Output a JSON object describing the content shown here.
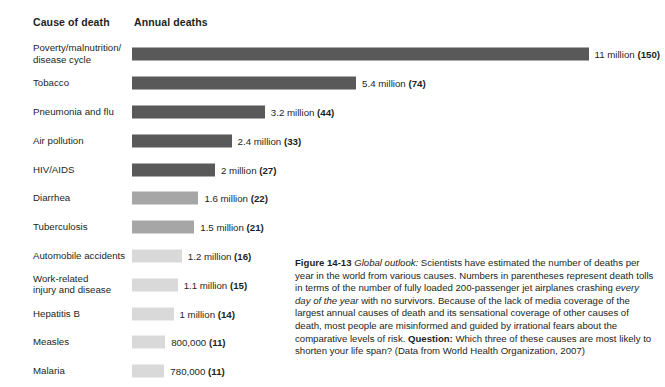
{
  "figure": {
    "headers": {
      "cause": "Cause of death",
      "deaths": "Annual deaths"
    },
    "caption": {
      "figure_number": "Figure 14-13",
      "title": "Global outlook:",
      "body_1": " Scientists have estimated the number of deaths per year in the world from various causes. Numbers in parentheses represent death tolls in terms of the number of fully loaded 200-passenger jet airplanes crashing ",
      "italic_phrase": "every day of the year",
      "body_2": " with no survivors. Because of the lack of media coverage of the largest annual causes of death and its sensational coverage of other causes of death, most people are misinformed and guided by irrational fears about the comparative levels of risk. ",
      "question_label": "Question:",
      "question_text": " Which three of these causes are most likely to shorten your life span? (Data from World Health Organization, 2007)"
    },
    "colors": {
      "bar_dark": "#595959",
      "bar_medium": "#a6a6a6",
      "bar_light": "#d9d9d9",
      "text": "#231f20",
      "background": "#ffffff"
    }
  },
  "chart_data": {
    "type": "bar",
    "orientation": "horizontal",
    "xlabel": "Annual deaths",
    "ylabel": "Cause of death",
    "units": "deaths per year",
    "grid": false,
    "legend": null,
    "xlim": [
      0,
      11
    ],
    "px_per_million": 41.5,
    "categories": [
      "Poverty/malnutrition/disease cycle",
      "Tobacco",
      "Pneumonia and flu",
      "Air pollution",
      "HIV/AIDS",
      "Diarrhea",
      "Tuberculosis",
      "Automobile accidents",
      "Work-related injury and disease",
      "Hepatitis B",
      "Measles",
      "Malaria"
    ],
    "values": [
      11000000,
      5400000,
      3200000,
      2400000,
      2000000,
      1600000,
      1500000,
      1200000,
      1100000,
      1000000,
      800000,
      780000
    ],
    "values_millions": [
      11,
      5.4,
      3.2,
      2.4,
      2,
      1.6,
      1.5,
      1.2,
      1.1,
      1,
      0.8,
      0.78
    ],
    "jet_equivalents": [
      150,
      74,
      44,
      33,
      27,
      22,
      21,
      16,
      15,
      14,
      11,
      11
    ],
    "rows": [
      {
        "label_line1": "Poverty/malnutrition/",
        "label_line2": "disease cycle",
        "value_text": "11 million ",
        "paren": "(150)",
        "millions": 11,
        "shade": "bar_dark"
      },
      {
        "label_line1": "Tobacco",
        "label_line2": "",
        "value_text": "5.4 million ",
        "paren": "(74)",
        "millions": 5.4,
        "shade": "bar_dark"
      },
      {
        "label_line1": "Pneumonia and flu",
        "label_line2": "",
        "value_text": "3.2 million ",
        "paren": "(44)",
        "millions": 3.2,
        "shade": "bar_dark"
      },
      {
        "label_line1": "Air pollution",
        "label_line2": "",
        "value_text": "2.4 million ",
        "paren": "(33)",
        "millions": 2.4,
        "shade": "bar_dark"
      },
      {
        "label_line1": "HIV/AIDS",
        "label_line2": "",
        "value_text": "2 million ",
        "paren": "(27)",
        "millions": 2,
        "shade": "bar_dark"
      },
      {
        "label_line1": "Diarrhea",
        "label_line2": "",
        "value_text": "1.6 million ",
        "paren": "(22)",
        "millions": 1.6,
        "shade": "bar_medium"
      },
      {
        "label_line1": "Tuberculosis",
        "label_line2": "",
        "value_text": "1.5 million ",
        "paren": "(21)",
        "millions": 1.5,
        "shade": "bar_medium"
      },
      {
        "label_line1": "Automobile accidents",
        "label_line2": "",
        "value_text": "1.2 million ",
        "paren": "(16)",
        "millions": 1.2,
        "shade": "bar_light"
      },
      {
        "label_line1": "Work-related",
        "label_line2": "injury and disease",
        "value_text": "1.1 million ",
        "paren": "(15)",
        "millions": 1.1,
        "shade": "bar_light"
      },
      {
        "label_line1": "Hepatitis B",
        "label_line2": "",
        "value_text": "1 million ",
        "paren": "(14)",
        "millions": 1,
        "shade": "bar_light"
      },
      {
        "label_line1": "Measles",
        "label_line2": "",
        "value_text": "800,000 ",
        "paren": "(11)",
        "millions": 0.8,
        "shade": "bar_light"
      },
      {
        "label_line1": "Malaria",
        "label_line2": "",
        "value_text": "780,000 ",
        "paren": "(11)",
        "millions": 0.78,
        "shade": "bar_light"
      }
    ]
  }
}
